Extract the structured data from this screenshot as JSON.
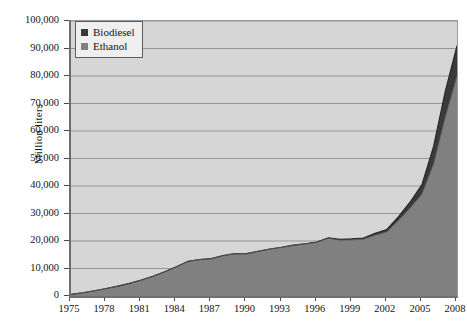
{
  "chart_data": {
    "type": "area",
    "stacked": true,
    "title": "",
    "subtitle": "",
    "xlabel": "",
    "ylabel": "Million liters",
    "xlim": [
      1975,
      2008
    ],
    "ylim": [
      0,
      100000
    ],
    "grid": true,
    "legend_position": "top-left",
    "x_tick_labels": [
      "1975",
      "1978",
      "1981",
      "1984",
      "1987",
      "1990",
      "1993",
      "1996",
      "1999",
      "2002",
      "2005",
      "2008"
    ],
    "y_tick_labels": [
      "0",
      "10,000",
      "20,000",
      "30,000",
      "40,000",
      "50,000",
      "60,000",
      "70,000",
      "80,000",
      "90,000",
      "100,000"
    ],
    "y_tick_values": [
      0,
      10000,
      20000,
      30000,
      40000,
      50000,
      60000,
      70000,
      80000,
      90000,
      100000
    ],
    "x": [
      1975,
      1976,
      1977,
      1978,
      1979,
      1980,
      1981,
      1982,
      1983,
      1984,
      1985,
      1986,
      1987,
      1988,
      1989,
      1990,
      1991,
      1992,
      1993,
      1994,
      1995,
      1996,
      1997,
      1998,
      1999,
      2000,
      2001,
      2002,
      2003,
      2004,
      2005,
      2006,
      2007,
      2008
    ],
    "series": [
      {
        "name": "Ethanol",
        "color": "#808080",
        "values": [
          600,
          1200,
          1900,
          2700,
          3600,
          4600,
          5800,
          7200,
          8800,
          10600,
          12600,
          13300,
          13600,
          14700,
          15400,
          15400,
          16300,
          17100,
          17700,
          18500,
          18900,
          19500,
          21000,
          20300,
          20400,
          20600,
          22100,
          23300,
          27500,
          32000,
          37000,
          48000,
          65000,
          80000
        ],
        "label_2008": 80000
      },
      {
        "name": "Biodiesel",
        "color": "#3a3a3a",
        "values": [
          0,
          0,
          0,
          0,
          0,
          0,
          0,
          0,
          0,
          0,
          0,
          0,
          0,
          0,
          0,
          0,
          0,
          0,
          0,
          0,
          100,
          150,
          200,
          300,
          400,
          500,
          700,
          900,
          1400,
          2200,
          3500,
          6500,
          9500,
          11000
        ],
        "label_2008": 11000
      }
    ],
    "legend": [
      {
        "label": "Biodiesel",
        "color": "#3a3a3a",
        "swatch": "square"
      },
      {
        "label": "Ethanol",
        "color": "#808080",
        "swatch": "square"
      }
    ],
    "plot_background": "#d6d6d6",
    "gridline_color": "#8e8e8e",
    "axis_color": "#6f6f6f"
  },
  "figure": {
    "caption_stub": ""
  }
}
